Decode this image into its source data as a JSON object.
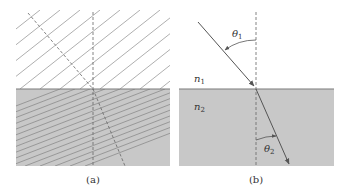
{
  "figure": {
    "panels": [
      {
        "id": "a",
        "caption": "(a)",
        "description": "Wavefront diagram: parallel oblique lines in upper medium, more closely spaced and less steep lines in shaded lower medium; dashed normal and dashed ray bending at interface"
      },
      {
        "id": "b",
        "caption": "(b)",
        "labels": {
          "n1": "n",
          "n1_sub": "1",
          "n2": "n",
          "n2_sub": "2",
          "theta1": "θ",
          "theta1_sub": "1",
          "theta2": "θ",
          "theta2_sub": "2"
        }
      }
    ],
    "colors": {
      "medium2_fill": "#c8c8c8",
      "interface": "#7a7a7a",
      "lines": "#8a8a8a",
      "ray": "#555555",
      "text": "#333333"
    }
  }
}
